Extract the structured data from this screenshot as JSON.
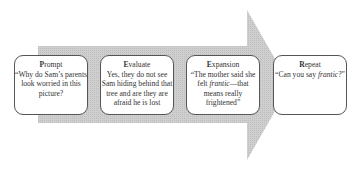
{
  "diagram": {
    "arrow_color": "#c8c8c8",
    "steps": [
      {
        "initial": "P",
        "rest": "rompt",
        "text": "“Why do Sam’s parents look worried in this picture?"
      },
      {
        "initial": "E",
        "rest": "valuate",
        "text": "Yes, they do not see Sam hiding behind that tree and are they are afraid he is lost"
      },
      {
        "initial": "E",
        "rest": "xpansion",
        "text_before": "“The mother said she felt ",
        "text_italic": "frantic",
        "text_after": "—that means really frightened”"
      },
      {
        "initial": "R",
        "rest": "epeat",
        "text_before": "“Can you say ",
        "text_italic": "frantic",
        "text_after": "?”"
      }
    ]
  }
}
